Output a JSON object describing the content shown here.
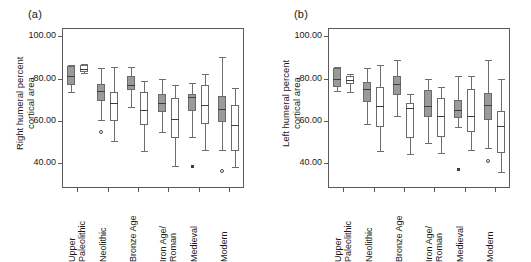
{
  "figure": {
    "background": "#ffffff",
    "box_dark_color": "#9a9a9a",
    "box_light_color": "#ffffff",
    "line_color": "#6e6e6e",
    "axis_color": "#595959"
  },
  "chart_data": [
    {
      "type": "box",
      "panel_tag": "(a)",
      "title": "",
      "xlabel": "",
      "ylabel": "Right humeral percent\ncortical area",
      "ylim": [
        28,
        104
      ],
      "yticks": [
        40,
        60,
        80,
        100
      ],
      "ytick_labels": [
        "40.00",
        "60.00",
        "80.00",
        "100.00"
      ],
      "grid": false,
      "legend": "none",
      "categories": [
        "Upper\nPaleolithic",
        "Neolithic",
        "Bronze Age",
        "Iron Age/\nRoman",
        "Medieval",
        "Modern"
      ],
      "series": [
        {
          "name": "dark",
          "fill": "#9a9a9a",
          "boxes": [
            {
              "category": "Upper Paleolithic",
              "whisker_low": 73.8,
              "q1": 77.0,
              "median": 81.2,
              "q3": 86.0,
              "whisker_high": 86.6,
              "outliers": []
            },
            {
              "category": "Neolithic",
              "whisker_low": 60.5,
              "q1": 69.4,
              "median": 74.2,
              "q3": 77.5,
              "whisker_high": 85.0,
              "outliers": [
                54.8
              ]
            },
            {
              "category": "Bronze Age",
              "whisker_low": 66.6,
              "q1": 74.4,
              "median": 77.0,
              "q3": 81.2,
              "whisker_high": 85.6,
              "outliers": []
            },
            {
              "category": "Iron Age/Roman",
              "whisker_low": 54.6,
              "q1": 64.0,
              "median": 68.4,
              "q3": 72.6,
              "whisker_high": 80.0,
              "outliers": []
            },
            {
              "category": "Medieval",
              "whisker_low": 52.4,
              "q1": 64.4,
              "median": 71.0,
              "q3": 72.8,
              "whisker_high": 78.0,
              "outliers": [
                38.2
              ]
            },
            {
              "category": "Modern",
              "whisker_low": 46.0,
              "q1": 59.2,
              "median": 65.4,
              "q3": 71.8,
              "whisker_high": 90.2,
              "outliers": [
                36.0
              ]
            }
          ]
        },
        {
          "name": "light",
          "fill": "#ffffff",
          "boxes": [
            {
              "category": "Upper Paleolithic",
              "whisker_low": 82.4,
              "q1": 83.0,
              "median": 84.6,
              "q3": 86.6,
              "whisker_high": 87.0,
              "outliers": []
            },
            {
              "category": "Neolithic",
              "whisker_low": 50.4,
              "q1": 59.8,
              "median": 68.4,
              "q3": 73.4,
              "whisker_high": 85.6,
              "outliers": []
            },
            {
              "category": "Bronze Age",
              "whisker_low": 45.8,
              "q1": 58.0,
              "median": 65.0,
              "q3": 73.4,
              "whisker_high": 79.0,
              "outliers": []
            },
            {
              "category": "Iron Age/Roman",
              "whisker_low": 38.4,
              "q1": 51.8,
              "median": 61.0,
              "q3": 70.8,
              "whisker_high": 77.0,
              "outliers": []
            },
            {
              "category": "Medieval",
              "whisker_low": 46.0,
              "q1": 58.2,
              "median": 67.6,
              "q3": 77.0,
              "whisker_high": 82.0,
              "outliers": []
            },
            {
              "category": "Modern",
              "whisker_low": 38.0,
              "q1": 45.4,
              "median": 58.0,
              "q3": 67.2,
              "whisker_high": 75.4,
              "outliers": []
            }
          ]
        }
      ]
    },
    {
      "type": "box",
      "panel_tag": "(b)",
      "title": "",
      "xlabel": "",
      "ylabel": "Left humeral percent\ncortical area",
      "ylim": [
        28,
        104
      ],
      "yticks": [
        40,
        60,
        80,
        100
      ],
      "ytick_labels": [
        "40.00",
        "60.00",
        "80.00",
        "100.00"
      ],
      "grid": false,
      "legend": "none",
      "categories": [
        "Upper\nPaleolithic",
        "Neolithic",
        "Bronze Age",
        "Iron Age/\nRoman",
        "Medieval",
        "Modern"
      ],
      "series": [
        {
          "name": "dark",
          "fill": "#9a9a9a",
          "boxes": [
            {
              "category": "Upper Paleolithic",
              "whisker_low": 74.2,
              "q1": 76.0,
              "median": 80.0,
              "q3": 85.0,
              "whisker_high": 85.4,
              "outliers": []
            },
            {
              "category": "Neolithic",
              "whisker_low": 58.2,
              "q1": 69.0,
              "median": 74.8,
              "q3": 78.2,
              "whisker_high": 84.8,
              "outliers": []
            },
            {
              "category": "Bronze Age",
              "whisker_low": 62.2,
              "q1": 72.2,
              "median": 77.4,
              "q3": 81.0,
              "whisker_high": 89.0,
              "outliers": []
            },
            {
              "category": "Iron Age/Roman",
              "whisker_low": 49.4,
              "q1": 61.8,
              "median": 66.8,
              "q3": 74.6,
              "whisker_high": 79.6,
              "outliers": []
            },
            {
              "category": "Medieval",
              "whisker_low": 57.0,
              "q1": 61.4,
              "median": 65.0,
              "q3": 69.8,
              "whisker_high": 81.0,
              "outliers": [
                36.8
              ]
            },
            {
              "category": "Modern",
              "whisker_low": 47.0,
              "q1": 60.2,
              "median": 67.6,
              "q3": 73.0,
              "whisker_high": 88.6,
              "outliers": [
                41.0
              ]
            }
          ]
        },
        {
          "name": "light",
          "fill": "#ffffff",
          "boxes": [
            {
              "category": "Upper Paleolithic",
              "whisker_low": 73.6,
              "q1": 77.4,
              "median": 79.4,
              "q3": 81.4,
              "whisker_high": 82.0,
              "outliers": []
            },
            {
              "category": "Neolithic",
              "whisker_low": 45.8,
              "q1": 57.2,
              "median": 67.0,
              "q3": 76.0,
              "whisker_high": 86.4,
              "outliers": []
            },
            {
              "category": "Bronze Age",
              "whisker_low": 44.0,
              "q1": 51.6,
              "median": 65.8,
              "q3": 68.6,
              "whisker_high": 72.6,
              "outliers": []
            },
            {
              "category": "Iron Age/Roman",
              "whisker_low": 44.8,
              "q1": 52.4,
              "median": 62.0,
              "q3": 70.8,
              "whisker_high": 76.0,
              "outliers": []
            },
            {
              "category": "Medieval",
              "whisker_low": 46.0,
              "q1": 54.4,
              "median": 62.0,
              "q3": 74.8,
              "whisker_high": 81.0,
              "outliers": []
            },
            {
              "category": "Modern",
              "whisker_low": 35.8,
              "q1": 44.6,
              "median": 57.6,
              "q3": 64.4,
              "whisker_high": 79.6,
              "outliers": []
            }
          ]
        }
      ]
    }
  ]
}
